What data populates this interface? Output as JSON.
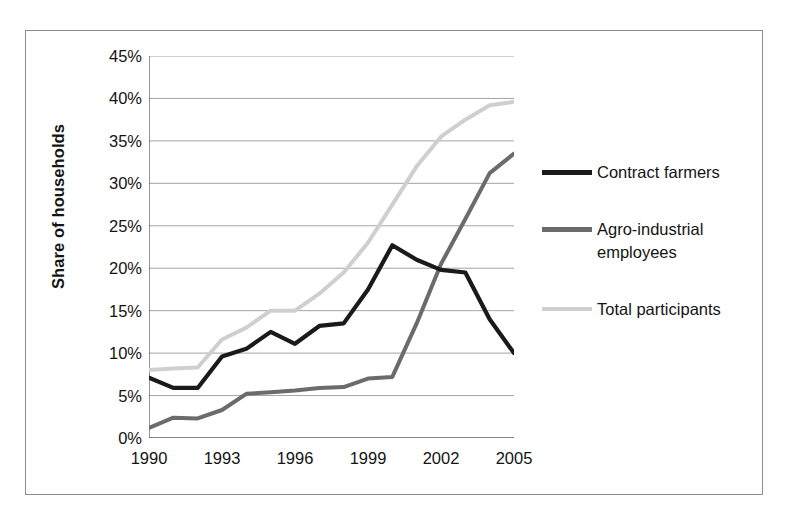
{
  "axis": {
    "y_title": "Share of households",
    "y_tick_labels": [
      "0%",
      "5%",
      "10%",
      "15%",
      "20%",
      "25%",
      "30%",
      "35%",
      "40%",
      "45%"
    ],
    "x_tick_labels": [
      "1990",
      "1993",
      "1996",
      "1999",
      "2002",
      "2005"
    ]
  },
  "legend": {
    "items": [
      {
        "label": "Contract farmers",
        "color": "#1a1a1a"
      },
      {
        "label": "Agro-industrial employees",
        "color": "#6b6b6b"
      },
      {
        "label": "Total participants",
        "color": "#cfcfcf"
      }
    ]
  },
  "colors": {
    "contract_farmers": "#1a1a1a",
    "agro_industrial": "#6b6b6b",
    "total_participants": "#cfcfcf",
    "gridline": "#9a9a9a",
    "axis": "#5a5a5a",
    "frame": "#8d8d8d",
    "text": "#141414"
  },
  "chart_data": {
    "type": "line",
    "title": "",
    "xlabel": "",
    "ylabel": "Share of households",
    "xlim": [
      1990,
      2005
    ],
    "ylim": [
      0,
      45
    ],
    "y_tick_step": 5,
    "y_unit": "%",
    "x_tick_step": 1,
    "x_label_step": 3,
    "grid": "horizontal",
    "legend_position": "right",
    "x": [
      1990,
      1991,
      1992,
      1993,
      1994,
      1995,
      1996,
      1997,
      1998,
      1999,
      2000,
      2001,
      2002,
      2003,
      2004,
      2005
    ],
    "series": [
      {
        "name": "Contract farmers",
        "color": "#1a1a1a",
        "values": [
          7.1,
          5.9,
          5.9,
          9.6,
          10.5,
          12.5,
          11.1,
          13.2,
          13.5,
          17.5,
          22.7,
          21.0,
          19.8,
          19.5,
          14.0,
          10.0
        ]
      },
      {
        "name": "Agro-industrial employees",
        "color": "#6b6b6b",
        "values": [
          1.2,
          2.4,
          2.3,
          3.3,
          5.2,
          5.4,
          5.6,
          5.9,
          6.0,
          7.0,
          7.2,
          13.5,
          20.5,
          25.8,
          31.2,
          33.5
        ]
      },
      {
        "name": "Total participants",
        "color": "#cfcfcf",
        "values": [
          8.0,
          8.2,
          8.3,
          11.6,
          13.0,
          15.0,
          15.0,
          17.0,
          19.5,
          23.0,
          27.5,
          32.0,
          35.5,
          37.5,
          39.2,
          39.6
        ]
      }
    ]
  }
}
